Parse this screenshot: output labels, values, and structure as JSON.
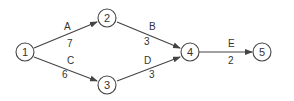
{
  "diagram": {
    "type": "activity-on-arrow network",
    "colors": {
      "stroke": "#444444",
      "text": "#333333",
      "background": "#ffffff"
    },
    "nodes": [
      {
        "id": "1",
        "label": "1",
        "x": 25,
        "y": 52
      },
      {
        "id": "2",
        "label": "2",
        "x": 107,
        "y": 18
      },
      {
        "id": "3",
        "label": "3",
        "x": 107,
        "y": 85
      },
      {
        "id": "4",
        "label": "4",
        "x": 190,
        "y": 52
      },
      {
        "id": "5",
        "label": "5",
        "x": 262,
        "y": 52
      }
    ],
    "edges": [
      {
        "from": "1",
        "to": "2",
        "activity": "A",
        "duration": "7"
      },
      {
        "from": "2",
        "to": "4",
        "activity": "B",
        "duration": "3"
      },
      {
        "from": "1",
        "to": "3",
        "activity": "C",
        "duration": "6"
      },
      {
        "from": "3",
        "to": "4",
        "activity": "D",
        "duration": "3"
      },
      {
        "from": "4",
        "to": "5",
        "activity": "E",
        "duration": "2"
      }
    ]
  }
}
